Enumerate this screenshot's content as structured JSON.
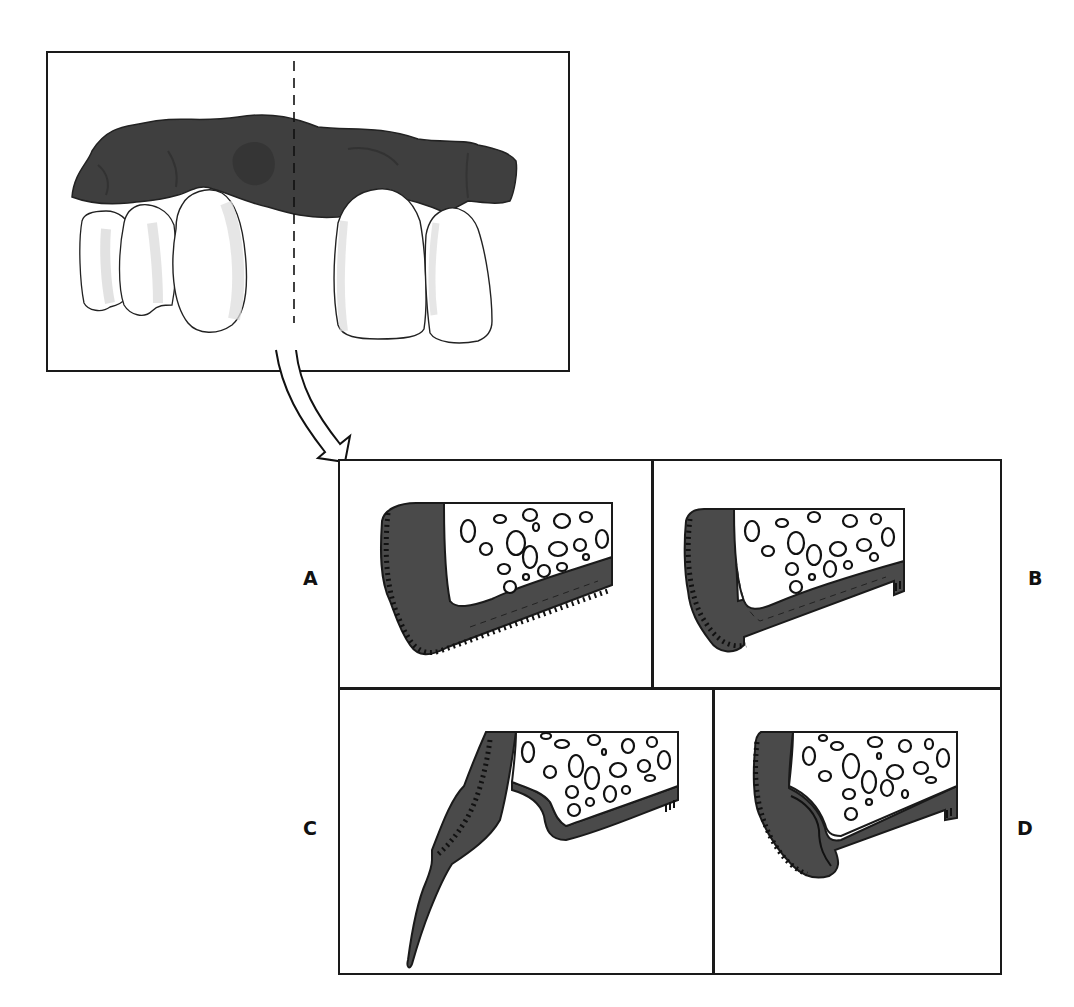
{
  "figure": {
    "overview": {
      "description": "Anterior maxillary teeth with dark tissue over the gingiva; a dashed vertical section line marks the cut plane",
      "section_line": "dashed"
    },
    "arrow": {
      "description": "Curved hollow arrow from the section line down to the cross-section panels"
    },
    "panels": [
      {
        "id": "A",
        "label": "A",
        "position": "top-left"
      },
      {
        "id": "B",
        "label": "B",
        "position": "top-right"
      },
      {
        "id": "C",
        "label": "C",
        "position": "bottom-left"
      },
      {
        "id": "D",
        "label": "D",
        "position": "bottom-right"
      }
    ],
    "colors": {
      "tissue": "#4a4a4a",
      "outline": "#1a1a1a",
      "bone_fill": "#ffffff",
      "tooth_shade": "#e2e2e2"
    },
    "caption": {
      "visible_text": ""
    }
  }
}
